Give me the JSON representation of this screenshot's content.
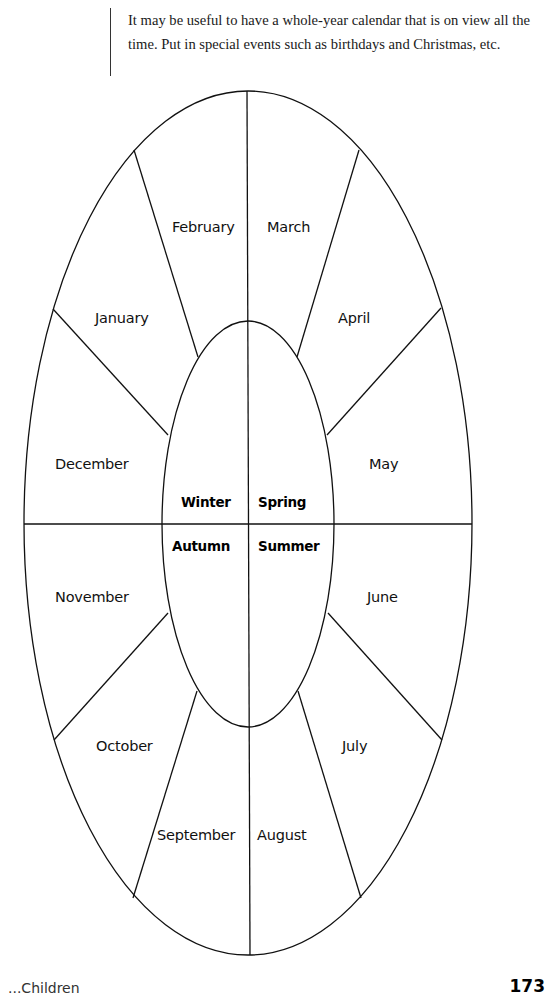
{
  "intro": {
    "line1": "It may be useful to have a whole-year calendar that is on view all the",
    "line2": "time. Put in special events such as birthdays and Christmas, etc."
  },
  "calendar": {
    "months": {
      "january": "January",
      "february": "February",
      "march": "March",
      "april": "April",
      "may": "May",
      "june": "June",
      "july": "July",
      "august": "August",
      "september": "September",
      "october": "October",
      "november": "November",
      "december": "December"
    },
    "seasons": {
      "winter": "Winter",
      "spring": "Spring",
      "summer": "Summer",
      "autumn": "Autumn"
    },
    "line_color": "#111111"
  },
  "footer": {
    "left_text": "...Children",
    "page_number": "173"
  }
}
